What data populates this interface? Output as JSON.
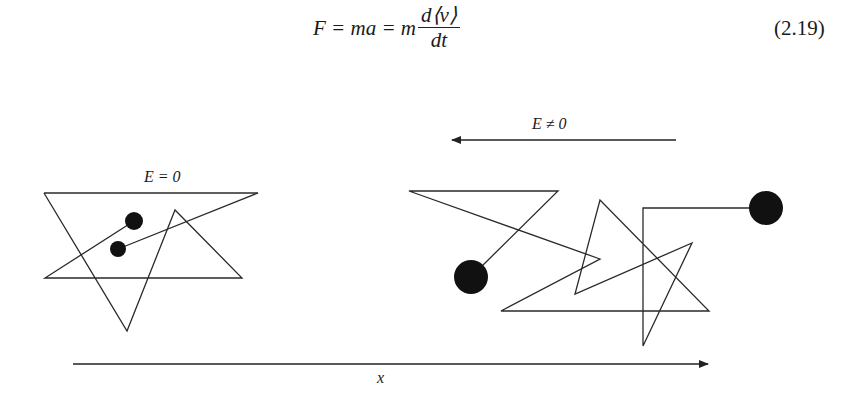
{
  "equation": {
    "lhs": "F = ma = m",
    "numerator": "d⟨v⟩",
    "denominator": "dt",
    "number": "(2.19)"
  },
  "diagram": {
    "left_panel": {
      "label": "E = 0",
      "paths": [
        [
          [
            44,
            193
          ],
          [
            258,
            193
          ]
        ],
        [
          [
            44,
            193
          ],
          [
            127,
            331
          ],
          [
            175,
            210
          ],
          [
            242,
            278
          ],
          [
            45,
            278
          ],
          [
            134,
            221
          ]
        ],
        [
          [
            118,
            249
          ],
          [
            258,
            193
          ]
        ]
      ],
      "particles": [
        {
          "cx": 134,
          "cy": 221,
          "r": 9
        },
        {
          "cx": 118,
          "cy": 249,
          "r": 8
        }
      ]
    },
    "right_panel": {
      "field_label": "E ≠ 0",
      "field_arrow": {
        "x1": 676,
        "y1": 140,
        "x2": 452,
        "y2": 140,
        "direction": "left"
      },
      "path": [
        [
          480,
          268
        ],
        [
          558,
          191
        ],
        [
          409,
          191
        ],
        [
          600,
          259
        ],
        [
          501,
          311
        ],
        [
          709,
          311
        ],
        [
          600,
          200
        ],
        [
          575,
          294
        ],
        [
          692,
          243
        ],
        [
          643,
          346
        ],
        [
          643,
          208
        ],
        [
          750,
          208
        ]
      ],
      "particles": [
        {
          "cx": 471,
          "cy": 277,
          "r": 17
        },
        {
          "cx": 766,
          "cy": 208,
          "r": 17
        }
      ]
    },
    "x_axis": {
      "label": "x",
      "x1": 73,
      "y1": 364,
      "x2": 708,
      "y2": 364
    },
    "stroke_color": "#2a2a2a",
    "particle_color": "#111111"
  }
}
